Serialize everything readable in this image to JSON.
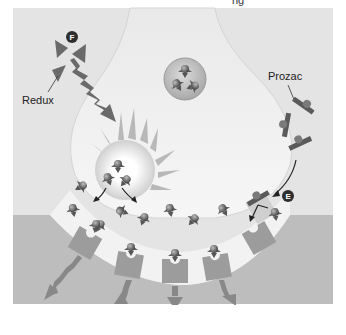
{
  "diagram": {
    "title_partial": "ng",
    "labels": {
      "redux": "Redux",
      "prozac": "Prozac"
    },
    "badges": {
      "redux_step": "F",
      "prozac_step": "E"
    },
    "colors": {
      "background": "#ffffff",
      "frame_bg": "#e6e6e6",
      "presynaptic": "#efefef",
      "synaptic_cleft": "#f4f4f4",
      "postsynaptic": "#bdbdbd",
      "receptor": "#9a9a9a",
      "molecule": "#6e6e6e",
      "drug": "#5a5a5a",
      "badge": "#2e2e2e",
      "arrow": "#8a8a8a"
    },
    "regions": [
      {
        "name": "presynaptic-terminal"
      },
      {
        "name": "synaptic-vesicle"
      },
      {
        "name": "synaptic-cleft"
      },
      {
        "name": "postsynaptic-membrane"
      }
    ]
  }
}
